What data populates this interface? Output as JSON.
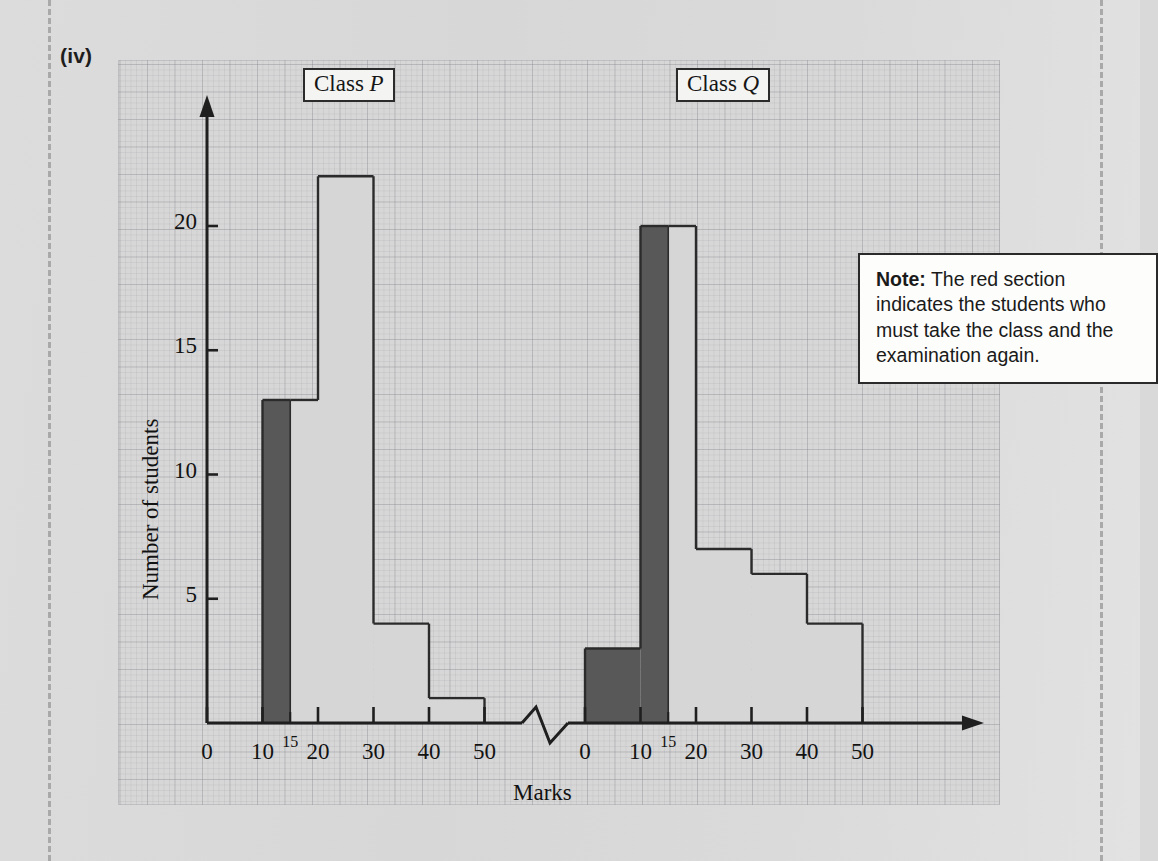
{
  "page": {
    "part_label": "(iv)"
  },
  "note": {
    "prefix": "Note:",
    "text": " The red section indicates the students who must take the class and the examination again."
  },
  "chart_data": {
    "type": "bar",
    "title": "",
    "xlabel": "Marks",
    "ylabel": "Number of students",
    "ylim": [
      0,
      23
    ],
    "yticks": [
      5,
      10,
      15,
      20
    ],
    "ytick_labels": [
      "5",
      "10",
      "15",
      "20"
    ],
    "grid": true,
    "axis_break": true,
    "axis_break_label": "zigzag-break",
    "groups": [
      {
        "name": "Class P",
        "label_plain": "Class ",
        "label_italic": "P",
        "xticks": [
          0,
          10,
          15,
          20,
          30,
          40,
          50
        ],
        "xtick_labels": [
          "0",
          "10",
          "15",
          "20",
          "30",
          "40",
          "50"
        ],
        "bars": [
          {
            "from": 0,
            "to": 10,
            "value": 0,
            "fill": "none"
          },
          {
            "from": 10,
            "to": 15,
            "value": 13,
            "fill": "dark"
          },
          {
            "from": 15,
            "to": 20,
            "value": 13,
            "fill": "light"
          },
          {
            "from": 20,
            "to": 30,
            "value": 22,
            "fill": "light"
          },
          {
            "from": 30,
            "to": 40,
            "value": 4,
            "fill": "light"
          },
          {
            "from": 40,
            "to": 50,
            "value": 1,
            "fill": "light"
          }
        ]
      },
      {
        "name": "Class Q",
        "label_plain": "Class ",
        "label_italic": "Q",
        "xticks": [
          0,
          10,
          15,
          20,
          30,
          40,
          50
        ],
        "xtick_labels": [
          "0",
          "10",
          "15",
          "20",
          "30",
          "40",
          "50"
        ],
        "bars": [
          {
            "from": 0,
            "to": 10,
            "value": 3,
            "fill": "dark"
          },
          {
            "from": 10,
            "to": 15,
            "value": 20,
            "fill": "dark"
          },
          {
            "from": 15,
            "to": 20,
            "value": 20,
            "fill": "light"
          },
          {
            "from": 20,
            "to": 30,
            "value": 7,
            "fill": "light"
          },
          {
            "from": 30,
            "to": 40,
            "value": 6,
            "fill": "light"
          },
          {
            "from": 40,
            "to": 50,
            "value": 4,
            "fill": "light"
          }
        ]
      }
    ],
    "colors": {
      "dark_section": "#585858",
      "light_section": "#d6d6d6",
      "outline": "#2b2b2b",
      "paper": "#d7d7d7"
    }
  }
}
